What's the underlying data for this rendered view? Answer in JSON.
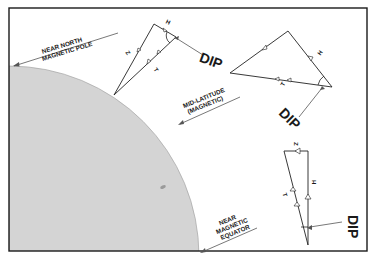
{
  "diagram": {
    "colors": {
      "frame": "#1a1a1a",
      "earth_fill": "#d4d4d4",
      "line": "#222222",
      "pointer": "#555555",
      "background": "#ffffff"
    },
    "locations": [
      {
        "id": "pole",
        "line1": "NEAR NORTH",
        "line2": "MAGNETIC POLE"
      },
      {
        "id": "mid",
        "line1": "MID-LATITUDE",
        "line2": "(MAGNETIC)"
      },
      {
        "id": "equator",
        "line1": "NEAR",
        "line2": "MAGNETIC",
        "line3": "EQUATOR"
      }
    ],
    "vectors": {
      "pole": {
        "z": "Z",
        "h": "H",
        "t": "T",
        "dip": "DIP"
      },
      "mid": {
        "h": "H",
        "t": "T",
        "dip": "DIP"
      },
      "equator": {
        "z": "Z",
        "h": "H",
        "t": "T",
        "dip": "DIP"
      }
    }
  }
}
